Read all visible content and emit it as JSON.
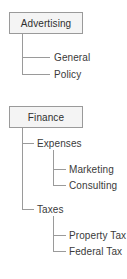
{
  "diagram": {
    "type": "tree",
    "background_color": "#ffffff",
    "line_color": "#9a9a9a",
    "text_color": "#3a3a3a",
    "box_fill_color": "#f4f4f4",
    "box_border_color": "#9a9a9a",
    "trees": [
      {
        "root": "Advertising",
        "children": [
          {
            "label": "General",
            "children": []
          },
          {
            "label": "Policy",
            "children": []
          }
        ]
      },
      {
        "root": "Finance",
        "children": [
          {
            "label": "Expenses",
            "children": [
              {
                "label": "Marketing",
                "children": []
              },
              {
                "label": "Consulting",
                "children": []
              }
            ]
          },
          {
            "label": "Taxes",
            "children": [
              {
                "label": "Property Tax",
                "children": []
              },
              {
                "label": "Federal Tax",
                "children": []
              }
            ]
          }
        ]
      }
    ]
  },
  "nodes": {
    "advertising": "Advertising",
    "general": "General",
    "policy": "Policy",
    "finance": "Finance",
    "expenses": "Expenses",
    "marketing": "Marketing",
    "consulting": "Consulting",
    "taxes": "Taxes",
    "property_tax": "Property Tax",
    "federal_tax": "Federal Tax"
  }
}
